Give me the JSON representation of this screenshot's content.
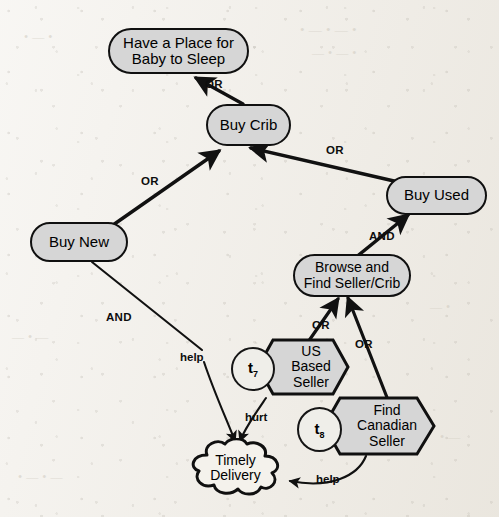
{
  "diagram": {
    "type": "goal-model",
    "background_color": "#f1eee8",
    "node_fill": "#d6d6d6",
    "stroke_color": "#101010"
  },
  "nodes": [
    {
      "id": "have-place",
      "kind": "goal",
      "label_line1": "Have a Place for",
      "label_line2": "Baby to Sleep"
    },
    {
      "id": "buy-crib",
      "kind": "goal",
      "label_line1": "Buy Crib",
      "label_line2": ""
    },
    {
      "id": "buy-used",
      "kind": "goal",
      "label_line1": "Buy Used",
      "label_line2": ""
    },
    {
      "id": "buy-new",
      "kind": "goal",
      "label_line1": "Buy New",
      "label_line2": ""
    },
    {
      "id": "browse-find",
      "kind": "goal",
      "label_line1": "Browse and",
      "label_line2": "Find Seller/Crib"
    },
    {
      "id": "us-seller",
      "kind": "task",
      "label_line1": "US",
      "label_line2": "Based",
      "label_line3": "Seller",
      "marker_label": "t",
      "marker_sub": "7"
    },
    {
      "id": "ca-seller",
      "kind": "task",
      "label_line1": "Find",
      "label_line2": "Canadian",
      "label_line3": "Seller",
      "marker_label": "t",
      "marker_sub": "8"
    },
    {
      "id": "timely",
      "kind": "softgoal",
      "label_line1": "Timely",
      "label_line2": "Delivery"
    }
  ],
  "edges": [
    {
      "id": "e1",
      "from": "buy-crib",
      "to": "have-place",
      "label": "OR"
    },
    {
      "id": "e2",
      "from": "buy-new",
      "to": "buy-crib",
      "label": "OR"
    },
    {
      "id": "e3",
      "from": "buy-used",
      "to": "buy-crib",
      "label": "OR"
    },
    {
      "id": "e4",
      "from": "browse-find",
      "to": "buy-used",
      "label": "AND"
    },
    {
      "id": "e5",
      "from": "us-seller",
      "to": "browse-find",
      "label": "OR"
    },
    {
      "id": "e6",
      "from": "ca-seller",
      "to": "browse-find",
      "label": "OR"
    },
    {
      "id": "e7",
      "from": "buy-new",
      "to": "timely",
      "label": "AND"
    },
    {
      "id": "e8",
      "from": "buy-new",
      "to": "timely",
      "label": "help"
    },
    {
      "id": "e9",
      "from": "us-seller",
      "to": "timely",
      "label": "hurt"
    },
    {
      "id": "e10",
      "from": "ca-seller",
      "to": "timely",
      "label": "help"
    }
  ],
  "edge_labels": {
    "or_top": "OR",
    "or_buy_new": "OR",
    "or_buy_used": "OR",
    "and_browse": "AND",
    "and_buy_new": "AND",
    "help_buy_new": "help",
    "or_us_seller": "OR",
    "or_ca_seller": "OR",
    "hurt_us": "hurt",
    "help_ca": "help"
  },
  "markers": {
    "t7_letter": "t",
    "t7_index": "7",
    "t8_letter": "t",
    "t8_index": "8"
  }
}
